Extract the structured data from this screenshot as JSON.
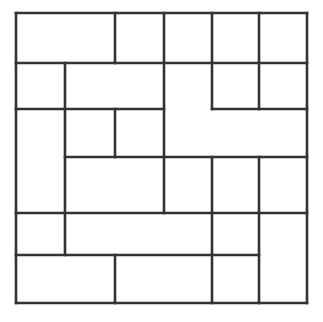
{
  "figure": {
    "type": "rectangle-partition-diagram",
    "title": "",
    "canvas": {
      "width": 323,
      "height": 322
    },
    "background_color": "#ffffff",
    "line_color": "#333333",
    "line_width": 2.6,
    "outer_border": {
      "x": 16,
      "y": 13,
      "width": 291,
      "height": 290
    },
    "grid": {
      "x_lines": [
        16,
        115,
        164,
        212,
        259,
        307
      ],
      "y_lines": [
        13,
        63,
        109,
        157,
        213,
        255,
        303
      ],
      "columns": 5,
      "rows": 6
    },
    "tiles": [
      {
        "name": "tile-1",
        "x": 16,
        "y": 13,
        "w": 99,
        "h": 50
      },
      {
        "name": "tile-2",
        "x": 115,
        "y": 13,
        "w": 49,
        "h": 50
      },
      {
        "name": "tile-3",
        "x": 164,
        "y": 13,
        "w": 48,
        "h": 50
      },
      {
        "name": "tile-4",
        "x": 212,
        "y": 13,
        "w": 47,
        "h": 50
      },
      {
        "name": "tile-5",
        "x": 259,
        "y": 13,
        "w": 48,
        "h": 50
      },
      {
        "name": "tile-6",
        "x": 16,
        "y": 63,
        "w": 49,
        "h": 46
      },
      {
        "name": "tile-7",
        "x": 65,
        "y": 63,
        "w": 99,
        "h": 46
      },
      {
        "name": "tile-8",
        "x": 164,
        "y": 63,
        "w": 48,
        "h": 94
      },
      {
        "name": "tile-9",
        "x": 212,
        "y": 63,
        "w": 47,
        "h": 46
      },
      {
        "name": "tile-10",
        "x": 259,
        "y": 63,
        "w": 48,
        "h": 46
      },
      {
        "name": "tile-11",
        "x": 16,
        "y": 109,
        "w": 49,
        "h": 104
      },
      {
        "name": "tile-12",
        "x": 65,
        "y": 109,
        "w": 50,
        "h": 48
      },
      {
        "name": "tile-13",
        "x": 115,
        "y": 109,
        "w": 49,
        "h": 48
      },
      {
        "name": "tile-14",
        "x": 212,
        "y": 109,
        "w": 47,
        "h": 48
      },
      {
        "name": "tile-15",
        "x": 259,
        "y": 109,
        "w": 48,
        "h": 48
      },
      {
        "name": "tile-16",
        "x": 65,
        "y": 157,
        "w": 147,
        "h": 56
      },
      {
        "name": "tile-17",
        "x": 212,
        "y": 157,
        "w": 47,
        "h": 56
      },
      {
        "name": "tile-18",
        "x": 259,
        "y": 157,
        "w": 48,
        "h": 56
      },
      {
        "name": "tile-19",
        "x": 16,
        "y": 213,
        "w": 49,
        "h": 42
      },
      {
        "name": "tile-20",
        "x": 65,
        "y": 213,
        "w": 147,
        "h": 42
      },
      {
        "name": "tile-21",
        "x": 212,
        "y": 213,
        "w": 47,
        "h": 42
      },
      {
        "name": "tile-22",
        "x": 259,
        "y": 213,
        "w": 48,
        "h": 90
      },
      {
        "name": "tile-23",
        "x": 16,
        "y": 255,
        "w": 99,
        "h": 48
      },
      {
        "name": "tile-24",
        "x": 115,
        "y": 255,
        "w": 49,
        "h": 48
      },
      {
        "name": "tile-25",
        "x": 164,
        "y": 255,
        "w": 48,
        "h": 48
      },
      {
        "name": "tile-26",
        "x": 212,
        "y": 255,
        "w": 47,
        "h": 48
      }
    ],
    "segments": [
      {
        "name": "outer-top",
        "x1": 16,
        "y1": 13,
        "x2": 307,
        "y2": 13
      },
      {
        "name": "outer-bottom",
        "x1": 16,
        "y1": 303,
        "x2": 307,
        "y2": 303
      },
      {
        "name": "outer-left",
        "x1": 16,
        "y1": 13,
        "x2": 16,
        "y2": 303
      },
      {
        "name": "outer-right",
        "x1": 307,
        "y1": 13,
        "x2": 307,
        "y2": 303
      },
      {
        "name": "h-row1-left",
        "x1": 16,
        "y1": 63,
        "x2": 307,
        "y2": 63
      },
      {
        "name": "h-y109-left",
        "x1": 16,
        "y1": 109,
        "x2": 164,
        "y2": 109
      },
      {
        "name": "h-y109-right",
        "x1": 212,
        "y1": 109,
        "x2": 307,
        "y2": 109
      },
      {
        "name": "h-y157-left",
        "x1": 65,
        "y1": 157,
        "x2": 307,
        "y2": 157
      },
      {
        "name": "h-y213-full",
        "x1": 16,
        "y1": 213,
        "x2": 307,
        "y2": 213
      },
      {
        "name": "h-y255-left",
        "x1": 16,
        "y1": 255,
        "x2": 259,
        "y2": 255
      },
      {
        "name": "v-x115-row1",
        "x1": 115,
        "y1": 13,
        "x2": 115,
        "y2": 63
      },
      {
        "name": "v-x164-top",
        "x1": 164,
        "y1": 13,
        "x2": 164,
        "y2": 213
      },
      {
        "name": "v-x212-row1",
        "x1": 212,
        "y1": 13,
        "x2": 212,
        "y2": 109
      },
      {
        "name": "v-x259-row1",
        "x1": 259,
        "y1": 13,
        "x2": 259,
        "y2": 109
      },
      {
        "name": "v-x65-mid",
        "x1": 65,
        "y1": 63,
        "x2": 65,
        "y2": 255
      },
      {
        "name": "v-x115-mid",
        "x1": 115,
        "y1": 109,
        "x2": 115,
        "y2": 157
      },
      {
        "name": "v-x212-lower",
        "x1": 212,
        "y1": 157,
        "x2": 212,
        "y2": 303
      },
      {
        "name": "v-x259-lower",
        "x1": 259,
        "y1": 157,
        "x2": 259,
        "y2": 303
      },
      {
        "name": "v-x115-bottom",
        "x1": 115,
        "y1": 255,
        "x2": 115,
        "y2": 303
      }
    ]
  }
}
